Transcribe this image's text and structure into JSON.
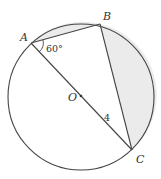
{
  "diagram": {
    "type": "circle-geometry",
    "circle": {
      "center": "O",
      "radius_px": 73
    },
    "points": [
      {
        "label": "A"
      },
      {
        "label": "B"
      },
      {
        "label": "C"
      },
      {
        "label": "O"
      }
    ],
    "segments": [
      "AB",
      "BC",
      "AC"
    ],
    "angle_label": "60°",
    "length_label": "4",
    "shaded_regions": [
      "segment between chord AB and arc AB",
      "segment between chord BC and arc BC"
    ],
    "colors": {
      "stroke": "#444444",
      "shade": "#ebebeb",
      "background": "#ffffff"
    }
  }
}
